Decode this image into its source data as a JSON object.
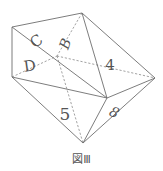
{
  "figure": {
    "caption": "図Ⅲ",
    "vertices": {
      "top": [
        82,
        13
      ],
      "left_top": [
        12,
        27
      ],
      "left_bottom": [
        12,
        77
      ],
      "hidden": [
        57,
        56
      ],
      "center_right": [
        107,
        98
      ],
      "right": [
        155,
        78
      ],
      "bottom": [
        83,
        143
      ]
    },
    "face_labels": [
      {
        "id": "C",
        "text": "C",
        "x": 37,
        "y": 42,
        "size": 15,
        "rotate": -35,
        "color": "#9a9a9a",
        "italic": false
      },
      {
        "id": "B",
        "text": "B",
        "x": 66,
        "y": 44,
        "size": 14,
        "rotate": -70,
        "color": "#555555",
        "italic": true
      },
      {
        "id": "D",
        "text": "D",
        "x": 30,
        "y": 67,
        "size": 15,
        "rotate": -8,
        "color": "#555555",
        "italic": false
      },
      {
        "id": "4",
        "text": "4",
        "x": 110,
        "y": 66,
        "size": 15,
        "rotate": 0,
        "color": "#555555",
        "italic": false
      },
      {
        "id": "5",
        "text": "5",
        "x": 65,
        "y": 115,
        "size": 17,
        "rotate": 0,
        "color": "#555555",
        "italic": false
      },
      {
        "id": "8",
        "text": "8",
        "x": 114,
        "y": 113,
        "size": 14,
        "rotate": 25,
        "color": "#555555",
        "italic": true
      }
    ]
  }
}
